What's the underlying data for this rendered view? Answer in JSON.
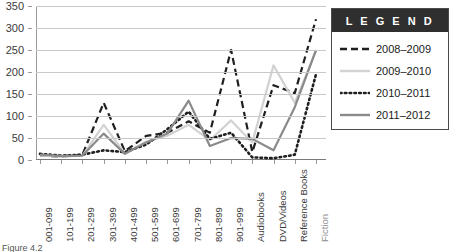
{
  "caption": "Figure 4.2",
  "legend": {
    "title": "L E G E N D",
    "items": [
      {
        "label": "2008–2009",
        "style": "dashed",
        "color": "#1f1f1f",
        "icon": "dashed-line-swatch"
      },
      {
        "label": "2009–2010",
        "style": "solid",
        "color": "#d2d2d2",
        "icon": "solid-line-swatch"
      },
      {
        "label": "2010–2011",
        "style": "dotted",
        "color": "#1f1f1f",
        "icon": "dotted-line-swatch"
      },
      {
        "label": "2011–2012",
        "style": "solid",
        "color": "#8a8a8a",
        "icon": "solid-line-swatch"
      }
    ]
  },
  "chart_data": {
    "type": "line",
    "title": "",
    "xlabel": "",
    "ylabel": "",
    "ylim": [
      0,
      350
    ],
    "yticks": [
      0,
      50,
      100,
      150,
      200,
      250,
      300,
      350
    ],
    "grid": true,
    "legend_position": "right",
    "categories": [
      "001-099",
      "101-199",
      "201-299",
      "301-399",
      "401-499",
      "501-599",
      "601-699",
      "701-799",
      "801-899",
      "901-999",
      "Audiobooks",
      "DVD/Videos",
      "Reference Books",
      "Fiction"
    ],
    "series": [
      {
        "name": "2008–2009",
        "color": "#1f1f1f",
        "style": "dashed",
        "values": [
          10,
          8,
          12,
          130,
          20,
          55,
          62,
          88,
          62,
          250,
          18,
          170,
          152,
          320
        ]
      },
      {
        "name": "2009–2010",
        "color": "#d2d2d2",
        "style": "solid",
        "values": [
          10,
          8,
          10,
          80,
          15,
          42,
          55,
          80,
          45,
          90,
          40,
          215,
          130,
          248
        ]
      },
      {
        "name": "2010–2011",
        "color": "#1f1f1f",
        "style": "dotted",
        "values": [
          14,
          10,
          12,
          22,
          18,
          35,
          70,
          110,
          48,
          62,
          6,
          4,
          12,
          195
        ]
      },
      {
        "name": "2011–2012",
        "color": "#8a8a8a",
        "style": "solid",
        "values": [
          12,
          9,
          10,
          60,
          14,
          40,
          60,
          135,
          32,
          50,
          48,
          22,
          120,
          250
        ]
      }
    ]
  }
}
